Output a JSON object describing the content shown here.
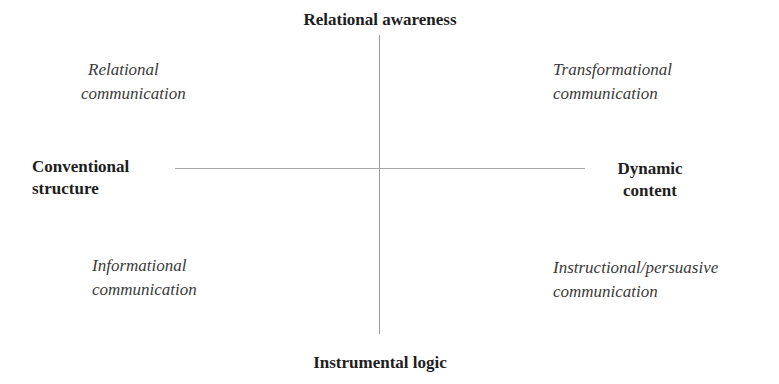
{
  "diagram": {
    "type": "quadrant",
    "axes": {
      "top": "Relational awareness",
      "bottom": "Instrumental logic",
      "left": {
        "line1": "Conventional",
        "line2": "structure"
      },
      "right": {
        "line1": "Dynamic",
        "line2": "content"
      }
    },
    "quadrants": {
      "top_left": {
        "line1": "Relational",
        "line2": "communication"
      },
      "top_right": {
        "line1": "Transformational",
        "line2": "communication"
      },
      "bottom_left": {
        "line1": "Informational",
        "line2": "communication"
      },
      "bottom_right": {
        "line1": "Instructional/persuasive",
        "line2": "communication"
      }
    }
  }
}
